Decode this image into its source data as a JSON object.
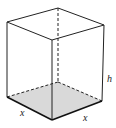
{
  "diagram": {
    "type": "rectangular-prism",
    "labels": {
      "base_left": "x",
      "base_right": "x",
      "height": "h"
    },
    "colors": {
      "edge": "#222222",
      "base_fill": "#d9d9d9"
    }
  }
}
